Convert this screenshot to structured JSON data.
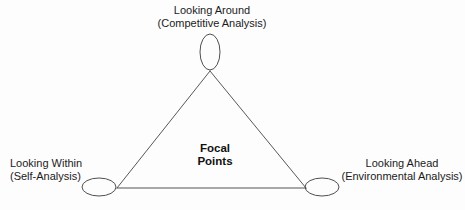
{
  "diagram": {
    "type": "triangle-concept-diagram",
    "title_center": {
      "line1": "Focal",
      "line2": "Points"
    },
    "nodes": [
      {
        "id": "looking-around",
        "position": "top",
        "label_line1": "Looking Around",
        "label_line2": "(Competitive Analysis)",
        "marker": "ellipse-vertical",
        "cx": 210,
        "cy": 52,
        "rx": 10,
        "ry": 18
      },
      {
        "id": "looking-within",
        "position": "bottom-left",
        "label_line1": "Looking Within",
        "label_line2": "(Self-Analysis)",
        "marker": "ellipse-horizontal",
        "cx": 99,
        "cy": 187,
        "rx": 17,
        "ry": 9
      },
      {
        "id": "looking-ahead",
        "position": "bottom-right",
        "label_line1": "Looking Ahead",
        "label_line2": "(Environmental Analysis)",
        "marker": "ellipse-horizontal",
        "cx": 322,
        "cy": 187,
        "rx": 17,
        "ry": 9
      }
    ],
    "triangle": {
      "apex": {
        "x": 210,
        "y": 71
      },
      "bottom_left": {
        "x": 117,
        "y": 188
      },
      "bottom_right": {
        "x": 306,
        "y": 188
      }
    },
    "colors": {
      "background": "#fdfdfd",
      "stroke": "#585858",
      "text": "#1b1b1b",
      "center_text": "#111111"
    },
    "stroke_width": 1
  }
}
